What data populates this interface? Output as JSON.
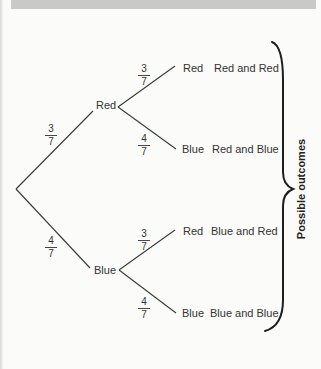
{
  "header": {
    "bar_color": "#c9c9c9"
  },
  "tree": {
    "first_stage": [
      {
        "outcome": "Red",
        "probability": {
          "numerator": "3",
          "denominator": "7"
        }
      },
      {
        "outcome": "Blue",
        "probability": {
          "numerator": "4",
          "denominator": "7"
        }
      }
    ],
    "second_stage": [
      {
        "parent": "Red",
        "outcome": "Red",
        "probability": {
          "numerator": "3",
          "denominator": "7"
        },
        "result": "Red and Red"
      },
      {
        "parent": "Red",
        "outcome": "Blue",
        "probability": {
          "numerator": "4",
          "denominator": "7"
        },
        "result": "Red and Blue"
      },
      {
        "parent": "Blue",
        "outcome": "Red",
        "probability": {
          "numerator": "3",
          "denominator": "7"
        },
        "result": "Blue and Red"
      },
      {
        "parent": "Blue",
        "outcome": "Blue",
        "probability": {
          "numerator": "4",
          "denominator": "7"
        },
        "result": "Blue and Blue"
      }
    ],
    "brace_label": "Possible outcomes"
  },
  "colors": {
    "line": "#3a3a3a",
    "brace": "#1e1e1e",
    "text": "#333333",
    "background": "#fbfbf9"
  }
}
